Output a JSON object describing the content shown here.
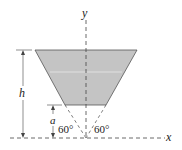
{
  "diagram": {
    "axes": {
      "x_label": "x",
      "y_label": "y"
    },
    "dimensions": {
      "height_label": "h",
      "offset_label": "a"
    },
    "angles": {
      "left": "60°",
      "right": "60°"
    },
    "colors": {
      "fill": "#c4c4c4",
      "stroke": "#555555",
      "axis": "#444444"
    }
  }
}
